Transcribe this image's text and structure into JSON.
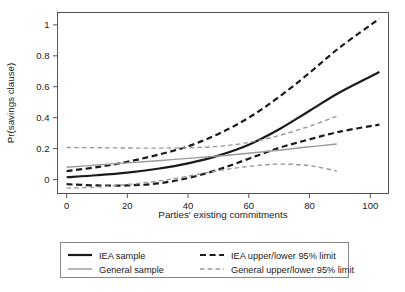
{
  "chart_data": {
    "type": "line",
    "title": "",
    "xlabel": "Parties' existing commitments",
    "ylabel": "Pr(savings clause)",
    "xlim": [
      -3,
      106
    ],
    "ylim": [
      -0.09,
      1.08
    ],
    "xticks": [
      0,
      20,
      40,
      60,
      80,
      100
    ],
    "xtick_labels": [
      "0",
      "20",
      "40",
      "60",
      "80",
      "100"
    ],
    "yticks": [
      0,
      0.2,
      0.4,
      0.6,
      0.8,
      1
    ],
    "ytick_labels": [
      "0",
      "0.2",
      "0.4",
      "0.6",
      "0.8",
      "1"
    ],
    "grid": false,
    "legend_position": "below-plot",
    "series": [
      {
        "name": "IEA sample",
        "style": "solid",
        "color": "#1a1a1a",
        "width": 2.2,
        "x": [
          0,
          10,
          20,
          30,
          40,
          50,
          60,
          70,
          80,
          90,
          103
        ],
        "values": [
          0.015,
          0.028,
          0.045,
          0.07,
          0.105,
          0.155,
          0.225,
          0.325,
          0.445,
          0.565,
          0.695
        ]
      },
      {
        "name": "IEA upper 95% limit",
        "style": "dashed",
        "color": "#1a1a1a",
        "width": 2.2,
        "x": [
          0,
          10,
          20,
          30,
          40,
          50,
          60,
          70,
          80,
          90,
          103
        ],
        "values": [
          0.055,
          0.08,
          0.115,
          0.16,
          0.215,
          0.295,
          0.4,
          0.535,
          0.69,
          0.855,
          1.04
        ]
      },
      {
        "name": "IEA lower 95% limit",
        "style": "dashed",
        "color": "#1a1a1a",
        "width": 2.2,
        "x": [
          0,
          10,
          20,
          30,
          40,
          50,
          60,
          70,
          80,
          90,
          103
        ],
        "values": [
          -0.03,
          -0.038,
          -0.038,
          -0.025,
          0.01,
          0.065,
          0.135,
          0.205,
          0.26,
          0.31,
          0.355
        ]
      },
      {
        "name": "General sample",
        "style": "solid",
        "color": "#9a9a9a",
        "width": 1.4,
        "x": [
          0,
          10,
          20,
          30,
          40,
          50,
          60,
          70,
          80,
          89
        ],
        "values": [
          0.08,
          0.094,
          0.108,
          0.122,
          0.137,
          0.152,
          0.17,
          0.19,
          0.212,
          0.23
        ]
      },
      {
        "name": "General upper 95% limit",
        "style": "dashed",
        "color": "#9a9a9a",
        "width": 1.4,
        "x": [
          0,
          10,
          20,
          30,
          40,
          50,
          60,
          70,
          80,
          89
        ],
        "values": [
          0.207,
          0.206,
          0.204,
          0.203,
          0.205,
          0.215,
          0.24,
          0.285,
          0.345,
          0.41
        ]
      },
      {
        "name": "General lower 95% limit",
        "style": "dashed",
        "color": "#9a9a9a",
        "width": 1.4,
        "x": [
          0,
          10,
          20,
          30,
          40,
          50,
          60,
          70,
          80,
          89
        ],
        "values": [
          -0.055,
          -0.048,
          -0.032,
          -0.01,
          0.022,
          0.058,
          0.085,
          0.1,
          0.09,
          0.055
        ]
      }
    ]
  },
  "axes": {
    "ylabel": "Pr(savings clause)",
    "xlabel": "Parties' existing commitments",
    "xtick_0": "0",
    "xtick_1": "20",
    "xtick_2": "40",
    "xtick_3": "60",
    "xtick_4": "80",
    "xtick_5": "100",
    "ytick_0": "0",
    "ytick_1": "0.2",
    "ytick_2": "0.4",
    "ytick_3": "0.6",
    "ytick_4": "0.8",
    "ytick_5": "1"
  },
  "legend": {
    "entries": [
      {
        "label": "IEA sample",
        "style": "solid",
        "color": "#1a1a1a"
      },
      {
        "label": "IEA upper/lower 95% limit",
        "style": "dashed",
        "color": "#1a1a1a"
      },
      {
        "label": "General sample",
        "style": "solid",
        "color": "#9a9a9a"
      },
      {
        "label": "General upper/lower 95% limit",
        "style": "dashed",
        "color": "#9a9a9a"
      }
    ]
  },
  "colors": {
    "iea": "#1a1a1a",
    "general": "#9a9a9a",
    "frame": "#555555",
    "background": "#ffffff"
  }
}
